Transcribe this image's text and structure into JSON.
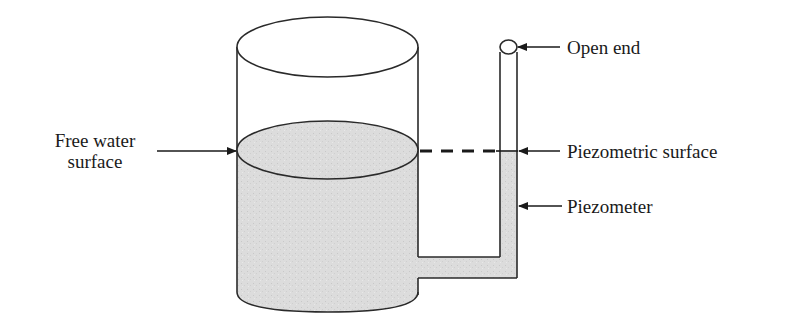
{
  "diagram": {
    "type": "piezometer-tank",
    "labels": {
      "free_water_surface_line1": "Free water",
      "free_water_surface_line2": "surface",
      "open_end": "Open end",
      "piezometric_surface": "Piezometric surface",
      "piezometer": "Piezometer"
    },
    "colors": {
      "water_fill": "#d9d9d9",
      "stroke": "#2a2a2a",
      "background": "#ffffff"
    }
  }
}
